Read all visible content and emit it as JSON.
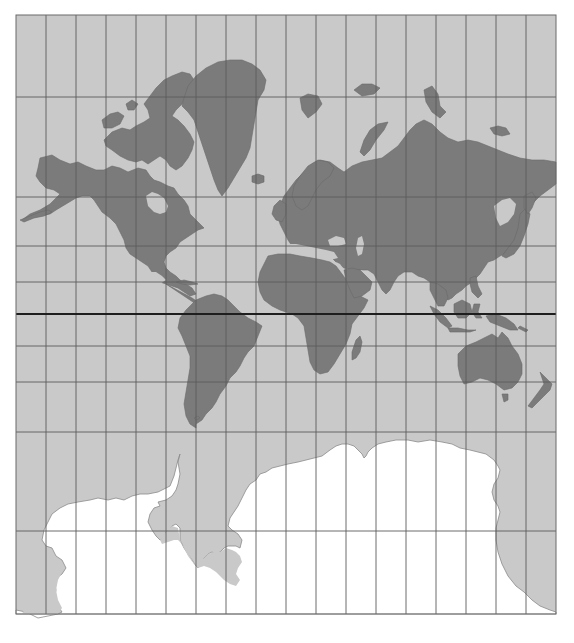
{
  "map": {
    "projection": "Mercator",
    "title": "",
    "colors": {
      "ocean": "#c9c9c9",
      "land": "#7b7b7b",
      "antarctica": "#ffffff",
      "graticule": "#5c5c5c",
      "equator": "#1e1e1e",
      "background": "#ffffff"
    },
    "frame": {
      "left": 16,
      "top": 15,
      "right": 556,
      "bottom": 614
    },
    "graticule": {
      "meridian_count": 19,
      "meridian_spacing_px": 30,
      "parallels_y_px": [
        97,
        197,
        246,
        282,
        346,
        382,
        432,
        531
      ],
      "equator_y_px": 314
    },
    "features": [
      "North America",
      "Greenland",
      "South America",
      "Europe",
      "Africa",
      "Asia",
      "Australia",
      "New Zealand",
      "Madagascar",
      "Antarctica",
      "Svalbard",
      "Novaya Zemlya",
      "Japan",
      "Indonesia",
      "Arctic Archipelago"
    ]
  }
}
